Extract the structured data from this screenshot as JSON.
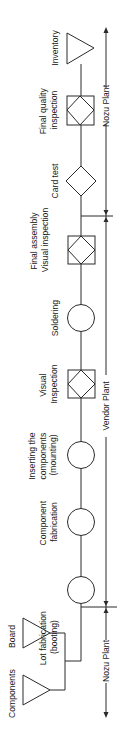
{
  "diagram": {
    "orientation": "rotated-90-ccw",
    "line_color": "#2a2a2a",
    "inputs": [
      {
        "id": "components",
        "label": "Components",
        "symbol": "storage-triangle"
      },
      {
        "id": "board",
        "label": "Board",
        "symbol": "storage-triangle"
      }
    ],
    "steps": [
      {
        "id": "lot-fabrication",
        "label_lines": [
          "Lot fabrication",
          "(booting)"
        ],
        "symbol": "operation-circle"
      },
      {
        "id": "component-fabrication",
        "label_lines": [
          "Component",
          "fabrication"
        ],
        "symbol": "operation-circle"
      },
      {
        "id": "inserting-components",
        "label_lines": [
          "Inserting the",
          "components",
          "(mounting)"
        ],
        "symbol": "operation-circle"
      },
      {
        "id": "visual-inspection",
        "label_lines": [
          "Visual",
          "Inspection"
        ],
        "symbol": "combined-inspection"
      },
      {
        "id": "soldering",
        "label_lines": [
          "Soldering"
        ],
        "symbol": "operation-circle"
      },
      {
        "id": "final-assembly-visual-inspection",
        "label_lines": [
          "Final assembly",
          "Visual inspection"
        ],
        "symbol": "combined-inspection"
      },
      {
        "id": "card-test",
        "label_lines": [
          "Card test"
        ],
        "symbol": "inspection-diamond"
      },
      {
        "id": "final-quality-inspection",
        "label_lines": [
          "Final quality",
          "inspection"
        ],
        "symbol": "combined-inspection"
      },
      {
        "id": "inventory",
        "label_lines": [
          "Inventory"
        ],
        "symbol": "storage-triangle"
      }
    ],
    "plant_sections": [
      {
        "id": "nozu-start",
        "label": "Nozu Plant"
      },
      {
        "id": "vendor",
        "label": "Vendor Plant"
      },
      {
        "id": "nozu-end",
        "label": "Nozu Plant"
      }
    ]
  }
}
